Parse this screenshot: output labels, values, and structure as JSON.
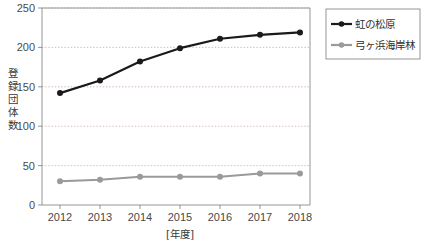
{
  "chart_data": {
    "type": "line",
    "title": "",
    "xlabel": "[年度]",
    "ylabel": "登録団体数",
    "categories": [
      "2012",
      "2013",
      "2014",
      "2015",
      "2016",
      "2017",
      "2018"
    ],
    "x": [
      2012,
      2013,
      2014,
      2015,
      2016,
      2017,
      2018
    ],
    "xlim": [
      2011.5,
      2018.6
    ],
    "ylim": [
      0,
      250
    ],
    "yticks": [
      "0",
      "50",
      "100",
      "150",
      "200",
      "250"
    ],
    "ytick_values": [
      0,
      50,
      100,
      150,
      200,
      250
    ],
    "grid": true,
    "grid_style": "dotted-horizontal",
    "legend_position": "right-top",
    "series": [
      {
        "name": "虹の松原",
        "color": "#1a1a1a",
        "marker": "circle-filled",
        "values": [
          142,
          158,
          182,
          199,
          211,
          216,
          219
        ]
      },
      {
        "name": "弓ヶ浜海岸林",
        "color": "#9a9a9a",
        "marker": "circle-filled",
        "values": [
          30,
          32,
          36,
          36,
          36,
          40,
          40
        ]
      }
    ]
  },
  "axis": {
    "y_label_chars": [
      "登",
      "録",
      "団",
      "体",
      "数"
    ]
  },
  "colors": {
    "series1": "#1a1a1a",
    "series2": "#9a9a9a",
    "grid": "#c9a9a9",
    "frame": "#8a8a8a",
    "text": "#3a3a3a",
    "background": "#ffffff"
  }
}
